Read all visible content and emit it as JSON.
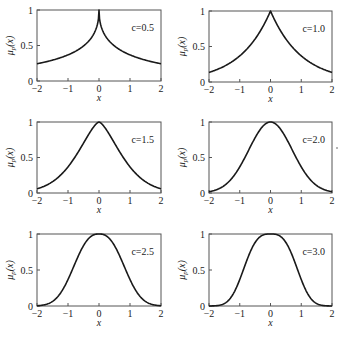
{
  "chart_data": [
    {
      "type": "line",
      "panel": "top-left",
      "annotation": "c=0.5",
      "c": 0.5,
      "xlabel": "x",
      "ylabel": "μ_p(x)",
      "xlim": [
        -2,
        2
      ],
      "ylim": [
        0,
        1
      ],
      "xticks": [
        "-2",
        "-1",
        "0",
        "1",
        "2"
      ],
      "yticks": [
        "0",
        "0.5",
        "1"
      ],
      "x": [
        -2,
        -1.5,
        -1,
        -0.5,
        -0.25,
        0,
        0.25,
        0.5,
        1,
        1.5,
        2
      ],
      "y": [
        0.24,
        0.29,
        0.36,
        0.47,
        0.58,
        1.0,
        0.58,
        0.47,
        0.36,
        0.29,
        0.24
      ]
    },
    {
      "type": "line",
      "panel": "top-right",
      "annotation": "c=1.0",
      "c": 1.0,
      "xlabel": "x",
      "ylabel": "μ_p(x)",
      "xlim": [
        -2,
        2
      ],
      "ylim": [
        0,
        1
      ],
      "xticks": [
        "-2",
        "-1",
        "0",
        "1",
        "2"
      ],
      "yticks": [
        "0",
        "0.5",
        "1"
      ],
      "x": [
        -2,
        -1.5,
        -1,
        -0.5,
        0,
        0.5,
        1,
        1.5,
        2
      ],
      "y": [
        0.14,
        0.22,
        0.37,
        0.61,
        1.0,
        0.61,
        0.37,
        0.22,
        0.14
      ]
    },
    {
      "type": "line",
      "panel": "middle-left",
      "annotation": "c=1.5",
      "c": 1.5,
      "xlabel": "x",
      "ylabel": "μ_p(x)",
      "xlim": [
        -2,
        2
      ],
      "ylim": [
        0,
        1
      ],
      "xticks": [
        "-2",
        "-1",
        "0",
        "1",
        "2"
      ],
      "yticks": [
        "0",
        "0.5",
        "1"
      ],
      "x": [
        -2,
        -1.5,
        -1,
        -0.5,
        0,
        0.5,
        1,
        1.5,
        2
      ],
      "y": [
        0.06,
        0.16,
        0.37,
        0.7,
        1.0,
        0.7,
        0.37,
        0.16,
        0.06
      ]
    },
    {
      "type": "line",
      "panel": "middle-right",
      "annotation": "c=2.0",
      "c": 2.0,
      "xlabel": "x",
      "ylabel": "μ_p(x)",
      "xlim": [
        -2,
        2
      ],
      "ylim": [
        0,
        1
      ],
      "xticks": [
        "-2",
        "-1",
        "0",
        "1",
        "2"
      ],
      "yticks": [
        "0",
        "0.5",
        "1"
      ],
      "x": [
        -2,
        -1.5,
        -1,
        -0.5,
        0,
        0.5,
        1,
        1.5,
        2
      ],
      "y": [
        0.02,
        0.11,
        0.37,
        0.78,
        1.0,
        0.78,
        0.37,
        0.11,
        0.02
      ]
    },
    {
      "type": "line",
      "panel": "bottom-left",
      "annotation": "c=2.5",
      "c": 2.5,
      "xlabel": "x",
      "ylabel": "μ_p(x)",
      "xlim": [
        -2,
        2
      ],
      "ylim": [
        0,
        1
      ],
      "xticks": [
        "-2",
        "-1",
        "0",
        "1",
        "2"
      ],
      "yticks": [
        "0",
        "0.5",
        "1"
      ],
      "x": [
        -2,
        -1.5,
        -1,
        -0.5,
        0,
        0.5,
        1,
        1.5,
        2
      ],
      "y": [
        0.0,
        0.06,
        0.37,
        0.84,
        1.0,
        0.84,
        0.37,
        0.06,
        0.0
      ]
    },
    {
      "type": "line",
      "panel": "bottom-right",
      "annotation": "c=3.0",
      "c": 3.0,
      "xlabel": "x",
      "ylabel": "μ_p(x)",
      "xlim": [
        -2,
        2
      ],
      "ylim": [
        0,
        1
      ],
      "xticks": [
        "-2",
        "-1",
        "0",
        "1",
        "2"
      ],
      "yticks": [
        "0",
        "0.5",
        "1"
      ],
      "x": [
        -2,
        -1.6,
        -1.5,
        -1,
        -0.5,
        -0.25,
        0,
        0.25,
        0.5,
        1,
        1.5,
        1.6,
        2
      ],
      "y": [
        0.0,
        0.0,
        0.03,
        0.37,
        0.88,
        1.0,
        1.0,
        1.0,
        0.88,
        0.37,
        0.03,
        0.0,
        0.0
      ]
    }
  ],
  "panels": [
    {
      "annotation": "c=0.5",
      "ylabel": "μp(x)",
      "xlabel": "x"
    },
    {
      "annotation": "c=1.0",
      "ylabel": "μp(x)",
      "xlabel": "x"
    },
    {
      "annotation": "c=1.5",
      "ylabel": "μp(x)",
      "xlabel": "x"
    },
    {
      "annotation": "c=2.0",
      "ylabel": "μp(x)",
      "xlabel": "x"
    },
    {
      "annotation": "c=2.5",
      "ylabel": "μp(x)",
      "xlabel": "x"
    },
    {
      "annotation": "c=3.0",
      "ylabel": "μp(x)",
      "xlabel": "x"
    }
  ],
  "ticks": {
    "x": [
      "−2",
      "−1",
      "0",
      "1",
      "2"
    ],
    "y": [
      "0",
      "0.5",
      "1"
    ]
  }
}
